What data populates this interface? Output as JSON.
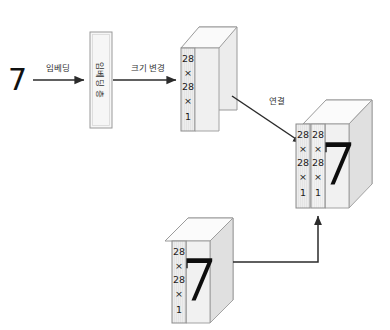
{
  "diagram": {
    "input": {
      "label": "7",
      "name": "input-digit"
    },
    "arrows": [
      {
        "id": "embed",
        "label": "임베딩"
      },
      {
        "id": "reshape",
        "label": "크기 변경"
      },
      {
        "id": "concat",
        "label": "연결"
      },
      {
        "id": "image-up",
        "label": ""
      }
    ],
    "embedding_layer": {
      "label": "임베딩 층"
    },
    "blocks": {
      "reshaped": {
        "name": "reshaped-embedding-tensor",
        "dims": [
          "28",
          "×",
          "28",
          "×",
          "1"
        ],
        "has_digit": false,
        "digit": ""
      },
      "image": {
        "name": "input-image-tensor",
        "dims": [
          "28",
          "×",
          "28",
          "×",
          "1"
        ],
        "has_digit": true,
        "digit": "7"
      },
      "concat_front": {
        "name": "concat-tensor-slice-a",
        "dims": [
          "28",
          "×",
          "28",
          "×",
          "1"
        ]
      },
      "concat_back": {
        "name": "concat-tensor-slice-b",
        "dims": [
          "28",
          "×",
          "28",
          "×",
          "1"
        ],
        "digit": "7"
      }
    },
    "caption": "",
    "colors": {
      "face": "#ececec",
      "face_light": "#f4f4f4",
      "top_face": "#fbfbfb",
      "stroke": "#8c8c8c",
      "stroke_light": "#b5b5b5",
      "arrow": "#2b2b2b",
      "text": "#222222",
      "background": "#ffffff"
    }
  }
}
